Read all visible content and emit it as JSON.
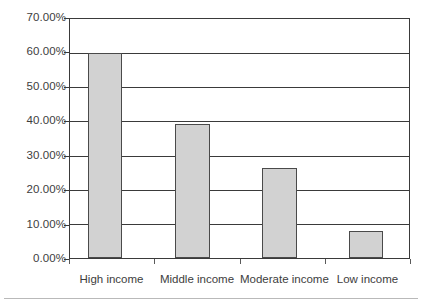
{
  "chart_data": {
    "type": "bar",
    "title": "",
    "subtitle": "",
    "xlabel": "",
    "ylabel": "",
    "categories": [
      "High income",
      "Middle income",
      "Moderate income",
      "Low income"
    ],
    "values": [
      60.0,
      39.3,
      26.5,
      7.8
    ],
    "value_labels": [
      "60.00%",
      "39.30%",
      "26.50%",
      "7.80%"
    ],
    "ylim": [
      0,
      70
    ],
    "ytick_values": [
      0,
      10,
      20,
      30,
      40,
      50,
      60,
      70
    ],
    "ytick_labels": [
      "0.00%",
      "10.00%",
      "20.00%",
      "30.00%",
      "40.00%",
      "50.00%",
      "60.00%",
      "70.00%"
    ],
    "grid": true,
    "grid_axis": "y",
    "legend": false,
    "legend_position": "none",
    "bar_fill_color": "#d2d2d2",
    "bar_border_color": "#4a4a4a",
    "axis_color": "#3a3a3a",
    "background_color": "#ffffff"
  },
  "axes": {
    "y_tick_0": "0.00%",
    "y_tick_1": "10.00%",
    "y_tick_2": "20.00%",
    "y_tick_3": "30.00%",
    "y_tick_4": "40.00%",
    "y_tick_5": "50.00%",
    "y_tick_6": "60.00%",
    "y_tick_7": "70.00%",
    "x_cat_0": "High income",
    "x_cat_1": "Middle income",
    "x_cat_2": "Moderate income",
    "x_cat_3": "Low income"
  }
}
